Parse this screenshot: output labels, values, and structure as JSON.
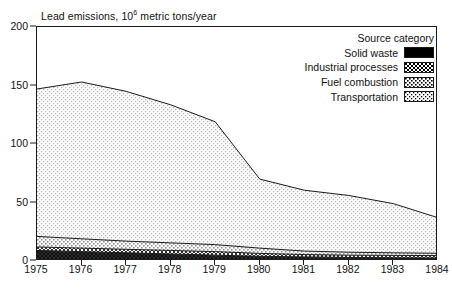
{
  "chart_data": {
    "type": "area",
    "stacked": true,
    "title_base": "Lead emissions, 10",
    "title_exponent": "6",
    "title_tail": " metric tons/year",
    "xlabel": "",
    "ylabel": "",
    "x": [
      1975,
      1976,
      1977,
      1978,
      1979,
      1980,
      1981,
      1982,
      1983,
      1984
    ],
    "xtick_labels": [
      "1975",
      "1976",
      "1977",
      "1978",
      "1979",
      "1980",
      "1981",
      "1982",
      "1983",
      "1984"
    ],
    "ytick_labels": [
      "0",
      "50",
      "100",
      "150",
      "200"
    ],
    "yticks": [
      0,
      50,
      100,
      150,
      200
    ],
    "ylim": [
      0,
      200
    ],
    "xlim": [
      1975,
      1984
    ],
    "grid": false,
    "legend_position": "top-right",
    "legend_title": "Source category",
    "series": [
      {
        "name": "Solid waste",
        "key": "solid_waste",
        "swatch": "sw-solid",
        "color": "#262626",
        "values": [
          9,
          8,
          7,
          6,
          5,
          4,
          3.5,
          3,
          2.8,
          2.6
        ]
      },
      {
        "name": "Industrial processes",
        "key": "industrial_processes",
        "swatch": "sw-industrial",
        "color": "#5d5d5d",
        "values": [
          3,
          3,
          3,
          3,
          3,
          2.5,
          2,
          2,
          2,
          2
        ]
      },
      {
        "name": "Fuel combustion",
        "key": "fuel_combustion",
        "swatch": "sw-fuel",
        "color": "#d2d2d2",
        "values": [
          9,
          8,
          7,
          6.5,
          6,
          4.5,
          3,
          2.5,
          2.2,
          2
        ]
      },
      {
        "name": "Transportation",
        "key": "transportation",
        "swatch": "sw-transport",
        "color": "#f2f2f2",
        "values": [
          126,
          134,
          128,
          118,
          105,
          59,
          52,
          48.5,
          42,
          30.4
        ]
      }
    ],
    "totals": [
      147,
      153,
      145,
      133.5,
      119,
      70,
      60.5,
      56,
      49,
      37
    ]
  }
}
